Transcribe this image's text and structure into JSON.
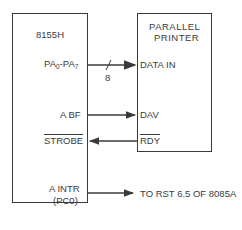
{
  "left_block": {
    "title": "8155H",
    "pins": {
      "port_a": {
        "name": "PA",
        "lo_sub": "0",
        "hi_sub": "7",
        "sep": "-"
      },
      "abf": "A BF",
      "strobe": "STROBE",
      "aintr": "A INTR",
      "aintr_pin": "(PC0)"
    }
  },
  "right_block": {
    "title_line1": "PARALLEL",
    "title_line2": "PRINTER",
    "pins": {
      "data_in": "DATA IN",
      "dav": "DAV",
      "rdy": "RDY"
    }
  },
  "bus": {
    "width_label": "8"
  },
  "external": {
    "interrupt_target": "TO RST 6.5 OF 8085A"
  },
  "colors": {
    "line": "#3a3a3a",
    "background": "#ffffff"
  }
}
